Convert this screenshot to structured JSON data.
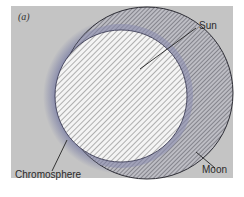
{
  "figure": {
    "panel_label": "(a)",
    "labels": {
      "sun": "Sun",
      "moon": "Moon",
      "chromosphere": "Chromosphere"
    },
    "colors": {
      "background": "#c4c4c4",
      "hatch": "#6a6a6a",
      "chromosphere_glow": "#7b7fa6",
      "sun_fill": "#f2f2f2"
    }
  }
}
